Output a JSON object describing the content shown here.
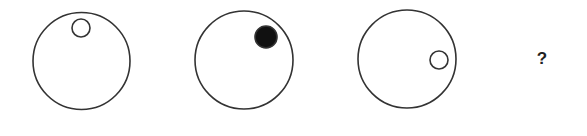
{
  "puzzle": {
    "question_mark": "?",
    "colors": {
      "stroke": "#333333",
      "fill_dot": "#111111",
      "background": "#ffffff"
    },
    "figures": [
      {
        "id": 1,
        "outer": {
          "cx": 81.5,
          "cy": 61,
          "r": 48.5
        },
        "inner": {
          "cx": 81,
          "cy": 28,
          "r": 9,
          "filled": false
        }
      },
      {
        "id": 2,
        "outer": {
          "cx": 244,
          "cy": 60,
          "r": 49
        },
        "inner": {
          "cx": 266,
          "cy": 37,
          "r": 11,
          "filled": true
        }
      },
      {
        "id": 3,
        "outer": {
          "cx": 407,
          "cy": 59,
          "r": 49
        },
        "inner": {
          "cx": 439,
          "cy": 60,
          "r": 9,
          "filled": false
        }
      }
    ]
  }
}
